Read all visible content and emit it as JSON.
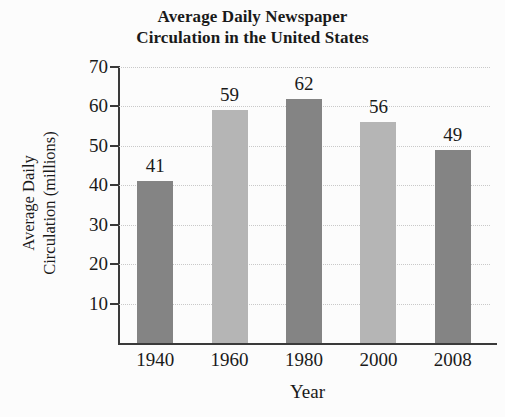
{
  "chart_data": {
    "type": "bar",
    "title": "Average Daily Newspaper Circulation in the United States",
    "title_lines": [
      "Average Daily Newspaper",
      "Circulation in the United States"
    ],
    "categories": [
      "1940",
      "1960",
      "1980",
      "2000",
      "2008"
    ],
    "values": [
      41,
      59,
      62,
      56,
      49
    ],
    "value_labels": [
      "41",
      "59",
      "62",
      "56",
      "49"
    ],
    "xlabel": "Year",
    "ylabel": "Average Daily Circulation (millions)",
    "ylabel_lines": [
      "Average Daily",
      "Circulation (millions)"
    ],
    "ylim": [
      0,
      70
    ],
    "yticks": [
      70,
      60,
      50,
      40,
      30,
      20,
      10
    ],
    "ytick_labels": [
      "70",
      "60",
      "50",
      "40",
      "30",
      "20",
      "10"
    ],
    "grid": true,
    "legend": null,
    "bar_colors": [
      "#848484",
      "#b5b5b5",
      "#848484",
      "#b5b5b5",
      "#848484"
    ],
    "colors": {
      "background": "#fcfcfc",
      "axis": "#3a3a3a",
      "gridline": "#c9c9c9",
      "text": "#1a1a1a",
      "bar_dark": "#848484",
      "bar_light": "#b5b5b5"
    }
  }
}
